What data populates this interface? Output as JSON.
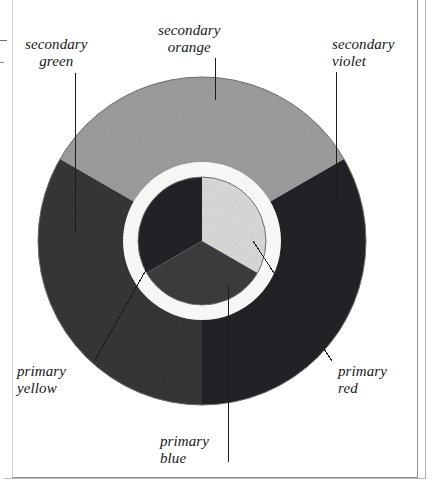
{
  "figure": {
    "type": "color-wheel-diagram",
    "background_color": "#ffffff",
    "label_text_color": "#17171a",
    "leader_line_color": "#1b1b1b"
  },
  "wheel": {
    "center_x": 202,
    "center_y": 241,
    "outer_radius": 164,
    "ring_inner_radius": 78,
    "gap_outer_radius": 78,
    "gap_inner_radius": 66,
    "inner_disc_radius": 64,
    "gap_color": "#fbfbf9",
    "outer_ring_edge_color": "#3b3b3b",
    "inner_disc_edge_color": "#555555"
  },
  "sectors": {
    "secondary": [
      {
        "name": "secondary-orange",
        "label_line1": "secondary",
        "label_line2": "orange",
        "fill": "#9c9c9c",
        "start_angle": -150,
        "end_angle": -30
      },
      {
        "name": "secondary-violet",
        "label_line1": "secondary",
        "label_line2": "violet",
        "fill": "#232326",
        "start_angle": -30,
        "end_angle": 90
      },
      {
        "name": "secondary-green",
        "label_line1": "secondary",
        "label_line2": "green",
        "fill": "#353538",
        "start_angle": 90,
        "end_angle": 210
      }
    ],
    "primary": [
      {
        "name": "primary-yellow",
        "label_line1": "primary",
        "label_line2": "yellow",
        "fill": "#d8d8d6",
        "start_angle": -90,
        "end_angle": 30
      },
      {
        "name": "primary-red",
        "label_line1": "primary",
        "label_line2": "red",
        "fill": "#232326",
        "start_angle": -90,
        "end_angle": -210
      },
      {
        "name": "primary-blue",
        "label_line1": "primary",
        "label_line2": "blue",
        "fill": "#3c3c3f",
        "start_angle": 30,
        "end_angle": 150
      }
    ]
  },
  "labels": {
    "secondary_green": {
      "line1": "secondary",
      "line2": "green"
    },
    "secondary_orange": {
      "line1": "secondary",
      "line2": "orange"
    },
    "secondary_violet": {
      "line1": "secondary",
      "line2": "violet"
    },
    "primary_yellow": {
      "line1": "primary",
      "line2": "yellow"
    },
    "primary_red": {
      "line1": "primary",
      "line2": "red"
    },
    "primary_blue": {
      "line1": "primary",
      "line2": "blue"
    }
  },
  "leader_lines": [
    {
      "name": "leader-secondary-green",
      "x1": 75,
      "y1": 73,
      "x2": 75,
      "y2": 233
    },
    {
      "name": "leader-secondary-orange",
      "x1": 215,
      "y1": 58,
      "x2": 215,
      "y2": 100
    },
    {
      "name": "leader-secondary-violet",
      "x1": 336,
      "y1": 72,
      "x2": 336,
      "y2": 203
    },
    {
      "name": "leader-primary-yellow",
      "x1": 95,
      "y1": 360,
      "x2": 163,
      "y2": 240
    },
    {
      "name": "leader-primary-red",
      "x1": 332,
      "y1": 361,
      "x2": 253,
      "y2": 241
    },
    {
      "name": "leader-primary-blue",
      "x1": 228,
      "y1": 462,
      "x2": 228,
      "y2": 285
    }
  ]
}
